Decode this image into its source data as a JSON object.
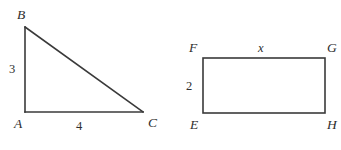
{
  "figure": {
    "background_color": "#ffffff",
    "stroke_color": "#3a3a3a",
    "text_color": "#2e2e2e",
    "stroke_width": 1.6,
    "width": 341,
    "height": 150
  },
  "triangle": {
    "name": "right-triangle-ABC",
    "vertices": {
      "B": {
        "label": "B",
        "x": 25,
        "y": 27,
        "label_x": 17,
        "label_y": 8
      },
      "A": {
        "label": "A",
        "x": 25,
        "y": 112,
        "label_x": 14,
        "label_y": 117
      },
      "C": {
        "label": "C",
        "x": 143,
        "y": 112,
        "label_x": 148,
        "label_y": 116
      }
    },
    "sides": [
      {
        "name": "AB",
        "measure": "3",
        "label_x": 9,
        "label_y": 63
      },
      {
        "name": "AC",
        "measure": "4",
        "label_x": 76,
        "label_y": 120
      },
      {
        "name": "BC",
        "measure": ""
      }
    ]
  },
  "rectangle": {
    "name": "rectangle-EFGH",
    "vertices": {
      "F": {
        "label": "F",
        "x": 203,
        "y": 58,
        "label_x": 189,
        "label_y": 41
      },
      "G": {
        "label": "G",
        "x": 325,
        "y": 58,
        "label_x": 327,
        "label_y": 41
      },
      "E": {
        "label": "E",
        "x": 203,
        "y": 113,
        "label_x": 190,
        "label_y": 118
      },
      "H": {
        "label": "H",
        "x": 325,
        "y": 113,
        "label_x": 327,
        "label_y": 118
      }
    },
    "sides": [
      {
        "name": "FG",
        "measure": "x",
        "label_x": 258,
        "label_y": 42
      },
      {
        "name": "FE",
        "measure": "2",
        "label_x": 186,
        "label_y": 80
      }
    ]
  }
}
